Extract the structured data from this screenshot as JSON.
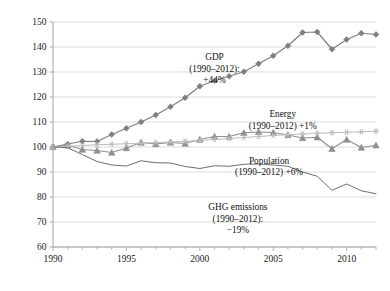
{
  "chart_data": {
    "type": "line",
    "title": "",
    "xlabel": "",
    "ylabel": "",
    "xlim": [
      1990,
      2012
    ],
    "ylim": [
      60,
      150
    ],
    "grid": true,
    "legend_position": "inline-annotations",
    "index_base": "1990 = 100",
    "x": [
      1990,
      1991,
      1992,
      1993,
      1994,
      1995,
      1996,
      1997,
      1998,
      1999,
      2000,
      2001,
      2002,
      2003,
      2004,
      2005,
      2006,
      2007,
      2008,
      2009,
      2010,
      2011,
      2012
    ],
    "x_tick_labels": [
      "1990",
      "1995",
      "2000",
      "2005",
      "2010"
    ],
    "x_tick_values": [
      1990,
      1995,
      2000,
      2005,
      2010
    ],
    "y_tick_labels": [
      "60",
      "70",
      "80",
      "90",
      "100",
      "110",
      "120",
      "130",
      "140",
      "150"
    ],
    "y_tick_values": [
      60,
      70,
      80,
      90,
      100,
      110,
      120,
      130,
      140,
      150
    ],
    "series": [
      {
        "name": "GDP",
        "marker": "diamond",
        "color": "#7f7f7f",
        "values": [
          100,
          101.2,
          102.3,
          102.2,
          105.0,
          107.5,
          110.0,
          112.8,
          116.1,
          119.7,
          124.3,
          126.5,
          128.3,
          130.1,
          133.3,
          136.5,
          140.5,
          145.8,
          146.0,
          139.1,
          143.0,
          145.5,
          145.0
        ]
      },
      {
        "name": "Energy",
        "marker": "triangle",
        "color": "#8f8f8f",
        "values": [
          100,
          100.7,
          99.0,
          98.6,
          97.8,
          99.6,
          101.8,
          101.2,
          101.8,
          101.4,
          103.0,
          104.2,
          104.2,
          105.7,
          106.0,
          105.8,
          104.8,
          103.6,
          103.9,
          99.3,
          103.0,
          99.8,
          100.7
        ]
      },
      {
        "name": "Population",
        "marker": "star",
        "color": "#bdbdbd",
        "values": [
          100,
          100.3,
          100.6,
          100.9,
          101.1,
          101.3,
          101.5,
          101.8,
          102.0,
          102.3,
          102.6,
          103.0,
          103.4,
          103.8,
          104.2,
          104.6,
          104.9,
          105.2,
          105.5,
          105.7,
          105.9,
          106.1,
          106.3
        ]
      },
      {
        "name": "GHG emissions",
        "marker": "none",
        "color": "#6e6e6e",
        "values": [
          100,
          99.7,
          97.0,
          94.2,
          92.8,
          92.4,
          94.5,
          93.7,
          93.6,
          92.2,
          91.4,
          92.5,
          92.3,
          93.1,
          93.2,
          92.8,
          92.3,
          90.0,
          88.3,
          82.7,
          85.2,
          82.5,
          81.3
        ]
      }
    ],
    "annotations": [
      {
        "id": "gdp-annotation",
        "lines": [
          "GDP",
          "(1990–2012):",
          "+44%"
        ],
        "x_pct": 55.0,
        "y_pct": 18.0
      },
      {
        "id": "energy-annotation",
        "lines": [
          "Energy",
          "(1990–2012) +1%"
        ],
        "x_pct": 72.5,
        "y_pct": 37.5
      },
      {
        "id": "population-annotation",
        "lines": [
          "Population",
          "(1990–2012) +6%"
        ],
        "x_pct": 69.0,
        "y_pct": 53.5
      },
      {
        "id": "ghg-annotation",
        "lines": [
          "GHG emissions",
          "(1990–2012):",
          "−19%"
        ],
        "x_pct": 61.0,
        "y_pct": 69.5
      }
    ]
  }
}
